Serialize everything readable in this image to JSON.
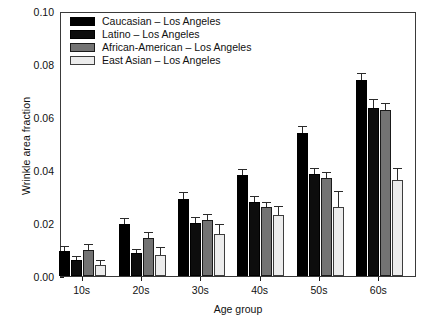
{
  "chart_data": {
    "type": "bar",
    "title": "",
    "xlabel": "Age group",
    "ylabel": "Wrinkle area fraction",
    "categories": [
      "10s",
      "20s",
      "30s",
      "40s",
      "50s",
      "60s"
    ],
    "ylim": [
      0.0,
      0.1
    ],
    "yticks": [
      "0.00",
      "0.02",
      "0.04",
      "0.06",
      "0.08",
      "0.10"
    ],
    "ytick_values": [
      0.0,
      0.02,
      0.04,
      0.06,
      0.08,
      0.1
    ],
    "grid": false,
    "legend_position": "top-left",
    "series": [
      {
        "name": "Caucasian – Los Angeles",
        "color": "#000000",
        "values": [
          0.0093,
          0.0195,
          0.029,
          0.038,
          0.054,
          0.074
        ],
        "errors": [
          0.0017,
          0.0021,
          0.0022,
          0.002,
          0.0022,
          0.0022
        ]
      },
      {
        "name": "Latino – Los Angeles",
        "color": "#0d0d0d",
        "values": [
          0.006,
          0.0087,
          0.02,
          0.028,
          0.0385,
          0.0633
        ],
        "errors": [
          0.0013,
          0.0013,
          0.0019,
          0.0018,
          0.002,
          0.0033
        ]
      },
      {
        "name": "African-American – Los Angeles",
        "color": "#737373",
        "values": [
          0.0098,
          0.0145,
          0.021,
          0.026,
          0.037,
          0.0625
        ],
        "errors": [
          0.002,
          0.0018,
          0.0019,
          0.0017,
          0.0018,
          0.0024
        ]
      },
      {
        "name": "East Asian – Los Angeles",
        "color": "#ececec",
        "values": [
          0.004,
          0.008,
          0.0158,
          0.023,
          0.026,
          0.0363
        ],
        "errors": [
          0.0017,
          0.0024,
          0.0035,
          0.0032,
          0.0058,
          0.0042
        ]
      }
    ]
  }
}
